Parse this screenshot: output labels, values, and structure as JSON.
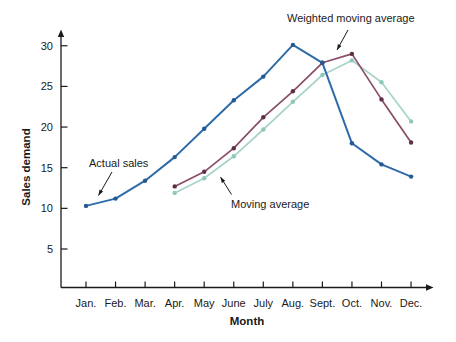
{
  "chart_data": {
    "type": "line",
    "title": "",
    "xlabel": "Month",
    "ylabel": "Sales demand",
    "x_tick_labels": [
      "Jan.",
      "Feb.",
      "Mar.",
      "Apr.",
      "May",
      "June",
      "July",
      "Aug.",
      "Sept.",
      "Oct.",
      "Nov.",
      "Dec."
    ],
    "y_ticks": [
      5,
      10,
      15,
      20,
      25,
      30
    ],
    "ylim": [
      0,
      32
    ],
    "grid": false,
    "legend_position": "inline-annotations",
    "background_color": "#ffffff",
    "axis_color": "#1a1a1a",
    "series": [
      {
        "name": "Actual sales",
        "color": "#2e6ba8",
        "marker_color": "#235a94",
        "start_month_index": 0,
        "values": [
          10.3,
          11.2,
          13.4,
          16.3,
          19.8,
          23.3,
          26.2,
          30.1,
          27.9,
          18.0,
          15.4,
          13.9
        ]
      },
      {
        "name": "Weighted moving average",
        "color": "#8a4d68",
        "marker_color": "#5e3048",
        "start_month_index": 3,
        "values": [
          12.7,
          14.5,
          17.4,
          21.2,
          24.4,
          27.9,
          29.0,
          23.4,
          18.1
        ]
      },
      {
        "name": "Moving average",
        "color": "#a7d4c9",
        "marker_color": "#8fc7ba",
        "start_month_index": 3,
        "values": [
          11.9,
          13.7,
          16.4,
          19.7,
          23.1,
          26.4,
          28.2,
          25.5,
          20.7
        ]
      }
    ],
    "annotations": [
      {
        "label": "Weighted moving average",
        "series": "Weighted moving average"
      },
      {
        "label": "Actual sales",
        "series": "Actual sales"
      },
      {
        "label": "Moving average",
        "series": "Moving average"
      }
    ]
  }
}
